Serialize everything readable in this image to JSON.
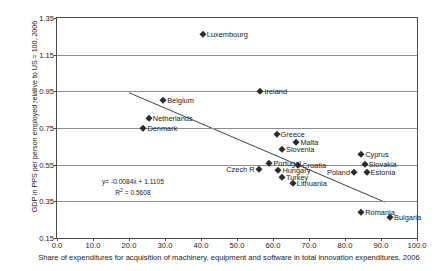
{
  "chart_data": {
    "type": "scatter",
    "title": "",
    "xlabel": "Share of expenditures for acquisition of machinery, equipment and software in total innovation expenditures, 2006",
    "ylabel": "GDP in PPS per person employed relative to US = 100, 2006",
    "xlim": [
      0.0,
      100.0
    ],
    "ylim": [
      0.15,
      1.35
    ],
    "xticks": [
      "0.0",
      "10.0",
      "20.0",
      "30.0",
      "40.0",
      "50.0",
      "60.0",
      "70.0",
      "80.0",
      "90.0",
      "100.0"
    ],
    "xtick_values": [
      0,
      10,
      20,
      30,
      40,
      50,
      60,
      70,
      80,
      90,
      100
    ],
    "yticks": [
      "1.35",
      "1.15",
      "0.95",
      "0.75",
      "0.55",
      "0.35",
      "0.15"
    ],
    "ytick_values": [
      1.35,
      1.15,
      0.95,
      0.75,
      0.55,
      0.35,
      0.15
    ],
    "grid": true,
    "legend": "none",
    "marker": "diamond",
    "marker_color": "#2b2b2b",
    "points": [
      {
        "label": "Luxembourg",
        "x": 40.5,
        "y": 1.265,
        "side": "right"
      },
      {
        "label": "Ireland",
        "x": 56.5,
        "y": 0.952,
        "side": "right"
      },
      {
        "label": "Belgium",
        "x": 29.5,
        "y": 0.905,
        "side": "right"
      },
      {
        "label": "Netherlands",
        "x": 25.5,
        "y": 0.805,
        "side": "right"
      },
      {
        "label": "Denmark",
        "x": 24.0,
        "y": 0.752,
        "side": "right"
      },
      {
        "label": "Greece",
        "x": 61.0,
        "y": 0.715,
        "side": "right"
      },
      {
        "label": "Malta",
        "x": 66.5,
        "y": 0.672,
        "side": "right"
      },
      {
        "label": "Slovenia",
        "x": 62.5,
        "y": 0.635,
        "side": "right"
      },
      {
        "label": "Cyprus",
        "x": 84.5,
        "y": 0.61,
        "side": "right"
      },
      {
        "label": "Portugal",
        "x": 59.0,
        "y": 0.56,
        "side": "right"
      },
      {
        "label": "Croatia",
        "x": 67.0,
        "y": 0.55,
        "side": "right"
      },
      {
        "label": "Slovakia",
        "x": 85.5,
        "y": 0.552,
        "side": "right"
      },
      {
        "label": "Czech R",
        "x": 56.0,
        "y": 0.528,
        "side": "left"
      },
      {
        "label": "Hungary",
        "x": 61.5,
        "y": 0.522,
        "side": "right"
      },
      {
        "label": "Poland",
        "x": 82.5,
        "y": 0.508,
        "side": "left"
      },
      {
        "label": "Estonia",
        "x": 86.0,
        "y": 0.508,
        "side": "right"
      },
      {
        "label": "Turkey",
        "x": 62.5,
        "y": 0.483,
        "side": "right"
      },
      {
        "label": "Lithuania",
        "x": 65.5,
        "y": 0.452,
        "side": "right"
      },
      {
        "label": "Romania",
        "x": 84.5,
        "y": 0.292,
        "side": "right"
      },
      {
        "label": "Bulgaria",
        "x": 92.5,
        "y": 0.262,
        "side": "right"
      }
    ],
    "trendline": {
      "slope": -0.0084,
      "intercept": 1.1105,
      "r_squared": 0.5608,
      "x_start": 20.0,
      "x_end": 91.0,
      "equation_text": "y= -0.0084x + 1.1105",
      "r2_prefix": "R",
      "r2_sup": "2",
      "r2_text": " = 0.5608"
    }
  }
}
